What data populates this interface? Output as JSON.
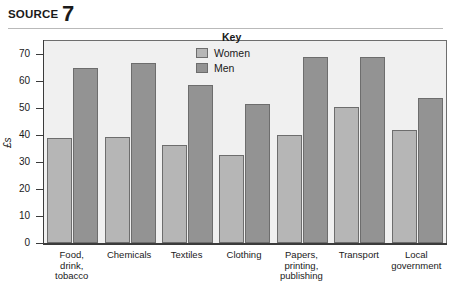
{
  "header": {
    "source_label": "SOURCE",
    "source_number": "7"
  },
  "legend": {
    "title": "Key",
    "items": [
      {
        "label": "Women",
        "color": "#b6b6b6"
      },
      {
        "label": "Men",
        "color": "#939393"
      }
    ]
  },
  "axis": {
    "y_title": "£s",
    "y_ticks": [
      "0",
      "10",
      "20",
      "30",
      "40",
      "50",
      "60",
      "70"
    ]
  },
  "chart_data": {
    "type": "bar",
    "title": "",
    "xlabel": "",
    "ylabel": "£s",
    "ylim": [
      0,
      75
    ],
    "grid": false,
    "legend_position": "inside-top-center",
    "categories": [
      "Food,\ndrink,\ntobacco",
      "Chemicals",
      "Textiles",
      "Clothing",
      "Papers,\nprinting,\npublishing",
      "Transport",
      "Local\ngovernment"
    ],
    "series": [
      {
        "name": "Women",
        "color": "#b6b6b6",
        "values": [
          39,
          39.5,
          36.5,
          32.5,
          40,
          50.5,
          42
        ]
      },
      {
        "name": "Men",
        "color": "#939393",
        "values": [
          65,
          67,
          58.5,
          51.5,
          69,
          69,
          54
        ]
      }
    ]
  }
}
